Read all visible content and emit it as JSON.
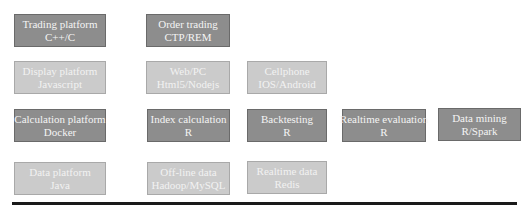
{
  "diagram": {
    "rows": [
      {
        "name": "trading-layer",
        "boxes": [
          {
            "title": "Trading platform",
            "tech": "C++/C",
            "shade": "dark"
          },
          {
            "title": "Order trading",
            "tech": "CTP/REM",
            "shade": "dark"
          }
        ]
      },
      {
        "name": "display-layer",
        "boxes": [
          {
            "title": "Display platform",
            "tech": "Javascript",
            "shade": "light"
          },
          {
            "title": "Web/PC",
            "tech": "Html5/Nodejs",
            "shade": "light"
          },
          {
            "title": "Cellphone",
            "tech": "IOS/Android",
            "shade": "light"
          }
        ]
      },
      {
        "name": "calculation-layer",
        "boxes": [
          {
            "title": "Calculation platform",
            "tech": "Docker",
            "shade": "dark"
          },
          {
            "title": "Index calculation",
            "tech": "R",
            "shade": "dark"
          },
          {
            "title": "Backtesting",
            "tech": "R",
            "shade": "dark"
          },
          {
            "title": "Realtime evaluation",
            "tech": "R",
            "shade": "dark"
          },
          {
            "title": "Data mining",
            "tech": "R/Spark",
            "shade": "dark"
          }
        ]
      },
      {
        "name": "data-layer",
        "boxes": [
          {
            "title": "Data platform",
            "tech": "Java",
            "shade": "light"
          },
          {
            "title": "Off-line data",
            "tech": "Hadoop/MySQL",
            "shade": "light"
          },
          {
            "title": "Realtime data",
            "tech": "Redis",
            "shade": "light"
          }
        ]
      }
    ],
    "colors": {
      "dark_box": "#8d8d8d",
      "light_box": "#cbcbcb",
      "text": "#f4f4f4",
      "baseline": "#1a1a1a"
    }
  }
}
